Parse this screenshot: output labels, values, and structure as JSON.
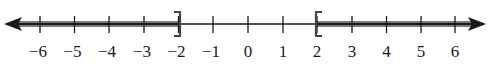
{
  "diagram": {
    "type": "number-line",
    "axis": {
      "min": -6,
      "max": 6,
      "arrows": [
        "left",
        "right"
      ],
      "color": "#1a1a1a"
    },
    "ticks": [
      {
        "value": -6,
        "label": "−6"
      },
      {
        "value": -5,
        "label": "−5"
      },
      {
        "value": -4,
        "label": "−4"
      },
      {
        "value": -3,
        "label": "−3"
      },
      {
        "value": -2,
        "label": "−2"
      },
      {
        "value": -1,
        "label": "−1"
      },
      {
        "value": 0,
        "label": "0"
      },
      {
        "value": 1,
        "label": "1"
      },
      {
        "value": 2,
        "label": "2"
      },
      {
        "value": 3,
        "label": "3"
      },
      {
        "value": 4,
        "label": "4"
      },
      {
        "value": 5,
        "label": "5"
      },
      {
        "value": 6,
        "label": "6"
      }
    ],
    "shaded_intervals": [
      {
        "from": "-infinity",
        "to": -2,
        "right_endpoint": "closed",
        "bracket": "]"
      },
      {
        "from": 2,
        "to": "infinity",
        "left_endpoint": "closed",
        "bracket": "["
      }
    ],
    "shade_color": "#6e6e6e"
  }
}
